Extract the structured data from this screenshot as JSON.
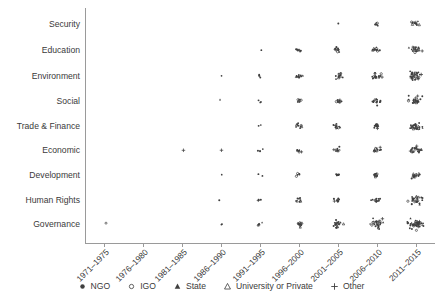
{
  "chart_data": {
    "type": "scatter",
    "title": "",
    "xlabel": "",
    "ylabel": "",
    "grid": false,
    "legend_position": "bottom-center",
    "x_categories": [
      "1971–1975",
      "1976–1980",
      "1981–1985",
      "1986–1990",
      "1991–1995",
      "1996–2000",
      "2001–2005",
      "2006–2010",
      "2011–2015"
    ],
    "y_categories": [
      "Security",
      "Education",
      "Environment",
      "Social",
      "Trade & Finance",
      "Economic",
      "Development",
      "Human Rights",
      "Governance"
    ],
    "series": [
      {
        "name": "NGO",
        "marker": "filled-circle",
        "color": "#3f3f3f"
      },
      {
        "name": "IGO",
        "marker": "open-circle",
        "color": "#3f3f3f"
      },
      {
        "name": "State",
        "marker": "filled-triangle",
        "color": "#3f3f3f"
      },
      {
        "name": "University or Private",
        "marker": "open-triangle",
        "color": "#3f3f3f"
      },
      {
        "name": "Other",
        "marker": "plus",
        "color": "#3f3f3f"
      }
    ],
    "counts": [
      {
        "y": "Security",
        "values": [
          0,
          0,
          0,
          0,
          0,
          0,
          1,
          6,
          11
        ]
      },
      {
        "y": "Education",
        "values": [
          0,
          0,
          0,
          0,
          1,
          8,
          9,
          12,
          19
        ]
      },
      {
        "y": "Environment",
        "values": [
          0,
          0,
          0,
          1,
          4,
          10,
          13,
          17,
          30
        ]
      },
      {
        "y": "Social",
        "values": [
          0,
          0,
          0,
          1,
          3,
          7,
          10,
          14,
          22
        ]
      },
      {
        "y": "Trade & Finance",
        "values": [
          0,
          0,
          0,
          0,
          2,
          9,
          11,
          13,
          26
        ]
      },
      {
        "y": "Economic",
        "values": [
          0,
          0,
          1,
          1,
          3,
          7,
          9,
          11,
          21
        ]
      },
      {
        "y": "Development",
        "values": [
          0,
          0,
          0,
          1,
          2,
          5,
          8,
          10,
          16
        ]
      },
      {
        "y": "Human Rights",
        "values": [
          0,
          0,
          0,
          1,
          3,
          8,
          10,
          13,
          25
        ]
      },
      {
        "y": "Governance",
        "values": [
          1,
          0,
          0,
          2,
          5,
          12,
          18,
          26,
          42
        ]
      }
    ]
  },
  "legend": {
    "items": [
      {
        "label": "NGO",
        "marker": "filled-circle"
      },
      {
        "label": "IGO",
        "marker": "open-circle"
      },
      {
        "label": "State",
        "marker": "filled-triangle"
      },
      {
        "label": "University or Private",
        "marker": "open-triangle"
      },
      {
        "label": "Other",
        "marker": "plus"
      }
    ]
  },
  "icons": {
    "filled_circle": "filled-circle-icon",
    "open_circle": "open-circle-icon",
    "filled_triangle": "filled-triangle-icon",
    "open_triangle": "open-triangle-icon",
    "plus": "plus-icon"
  }
}
